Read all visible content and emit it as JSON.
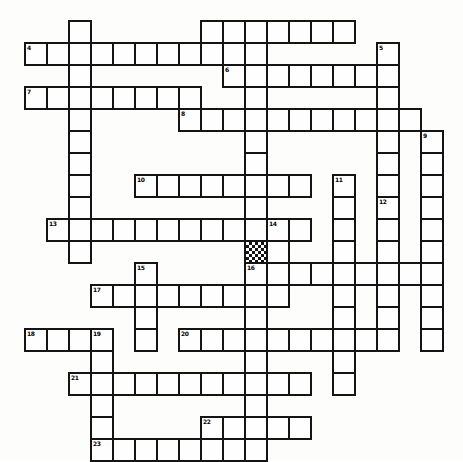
{
  "puzzle": {
    "title": "Crossword Puzzle Grid",
    "type": "crossword-grid",
    "grid_origin_x": 24,
    "grid_origin_y": 20,
    "cell_size": 22,
    "grid_columns": 20,
    "grid_rows": 20,
    "cell_fill_color": "#fefefe",
    "cell_border_color": "#141414",
    "background_color": "#fdfdfb",
    "shaded_cell_pattern": "checkerboard",
    "shaded_cells": [
      [
        10,
        10
      ]
    ],
    "entries": [
      {
        "number": "1",
        "direction": "down",
        "row": 0,
        "col": 2,
        "length": 11
      },
      {
        "number": "2",
        "direction": "down",
        "row": 0,
        "col": 8,
        "length": 2
      },
      {
        "number": "3",
        "direction": "across",
        "row": 0,
        "col": 10,
        "length": 5
      },
      {
        "number": "3",
        "direction": "down",
        "row": 0,
        "col": 10,
        "length": 13
      },
      {
        "number": "4",
        "direction": "across",
        "row": 1,
        "col": 0,
        "length": 10
      },
      {
        "number": "5",
        "direction": "down",
        "row": 1,
        "col": 16,
        "length": 9
      },
      {
        "number": "6",
        "direction": "across",
        "row": 2,
        "col": 9,
        "length": 7
      },
      {
        "number": "7",
        "direction": "across",
        "row": 3,
        "col": 0,
        "length": 8
      },
      {
        "number": "8",
        "direction": "across",
        "row": 4,
        "col": 7,
        "length": 11
      },
      {
        "number": "9",
        "direction": "down",
        "row": 5,
        "col": 18,
        "length": 9
      },
      {
        "number": "10",
        "direction": "across",
        "row": 7,
        "col": 5,
        "length": 8
      },
      {
        "number": "11",
        "direction": "down",
        "row": 7,
        "col": 14,
        "length": 7
      },
      {
        "number": "12",
        "direction": "down",
        "row": 8,
        "col": 16,
        "length": 6
      },
      {
        "number": "13",
        "direction": "across",
        "row": 9,
        "col": 1,
        "length": 12
      },
      {
        "number": "14",
        "direction": "down",
        "row": 9,
        "col": 11,
        "length": 3
      },
      {
        "number": "15",
        "direction": "down",
        "row": 11,
        "col": 5,
        "length": 4
      },
      {
        "number": "16",
        "direction": "across",
        "row": 11,
        "col": 10,
        "length": 8
      },
      {
        "number": "17",
        "direction": "across",
        "row": 12,
        "col": 3,
        "length": 9
      },
      {
        "number": "18",
        "direction": "across",
        "row": 14,
        "col": 0,
        "length": 4
      },
      {
        "number": "19",
        "direction": "down",
        "row": 14,
        "col": 3,
        "length": 7
      },
      {
        "number": "20",
        "direction": "across",
        "row": 14,
        "col": 7,
        "length": 9
      },
      {
        "number": "21",
        "direction": "across",
        "row": 16,
        "col": 2,
        "length": 11
      },
      {
        "number": "22",
        "direction": "across",
        "row": 18,
        "col": 8,
        "length": 5
      },
      {
        "number": "23",
        "direction": "across",
        "row": 19,
        "col": 3,
        "length": 7
      }
    ],
    "cells": [
      [
        0,
        2,
        ""
      ],
      [
        0,
        8,
        ""
      ],
      [
        0,
        9,
        ""
      ],
      [
        0,
        10,
        ""
      ],
      [
        0,
        11,
        ""
      ],
      [
        0,
        12,
        ""
      ],
      [
        0,
        13,
        ""
      ],
      [
        0,
        14,
        ""
      ],
      [
        1,
        0,
        "4"
      ],
      [
        1,
        1,
        ""
      ],
      [
        1,
        2,
        ""
      ],
      [
        1,
        3,
        ""
      ],
      [
        1,
        4,
        ""
      ],
      [
        1,
        5,
        ""
      ],
      [
        1,
        6,
        ""
      ],
      [
        1,
        7,
        ""
      ],
      [
        1,
        8,
        ""
      ],
      [
        1,
        9,
        ""
      ],
      [
        1,
        10,
        ""
      ],
      [
        1,
        16,
        "5"
      ],
      [
        2,
        2,
        ""
      ],
      [
        2,
        9,
        "6"
      ],
      [
        2,
        10,
        ""
      ],
      [
        2,
        11,
        ""
      ],
      [
        2,
        12,
        ""
      ],
      [
        2,
        13,
        ""
      ],
      [
        2,
        14,
        ""
      ],
      [
        2,
        15,
        ""
      ],
      [
        2,
        16,
        ""
      ],
      [
        3,
        0,
        "7"
      ],
      [
        3,
        1,
        ""
      ],
      [
        3,
        2,
        ""
      ],
      [
        3,
        3,
        ""
      ],
      [
        3,
        4,
        ""
      ],
      [
        3,
        5,
        ""
      ],
      [
        3,
        6,
        ""
      ],
      [
        3,
        7,
        ""
      ],
      [
        3,
        10,
        ""
      ],
      [
        3,
        16,
        ""
      ],
      [
        4,
        2,
        ""
      ],
      [
        4,
        7,
        "8"
      ],
      [
        4,
        8,
        ""
      ],
      [
        4,
        9,
        ""
      ],
      [
        4,
        10,
        ""
      ],
      [
        4,
        11,
        ""
      ],
      [
        4,
        12,
        ""
      ],
      [
        4,
        13,
        ""
      ],
      [
        4,
        14,
        ""
      ],
      [
        4,
        15,
        ""
      ],
      [
        4,
        16,
        ""
      ],
      [
        4,
        17,
        ""
      ],
      [
        5,
        2,
        ""
      ],
      [
        5,
        10,
        ""
      ],
      [
        5,
        16,
        ""
      ],
      [
        5,
        18,
        "9"
      ],
      [
        6,
        2,
        ""
      ],
      [
        6,
        10,
        ""
      ],
      [
        6,
        16,
        ""
      ],
      [
        6,
        18,
        ""
      ],
      [
        7,
        2,
        ""
      ],
      [
        7,
        5,
        "10"
      ],
      [
        7,
        6,
        ""
      ],
      [
        7,
        7,
        ""
      ],
      [
        7,
        8,
        ""
      ],
      [
        7,
        9,
        ""
      ],
      [
        7,
        10,
        ""
      ],
      [
        7,
        11,
        ""
      ],
      [
        7,
        12,
        ""
      ],
      [
        7,
        14,
        "11"
      ],
      [
        7,
        16,
        ""
      ],
      [
        7,
        18,
        ""
      ],
      [
        8,
        2,
        ""
      ],
      [
        8,
        10,
        ""
      ],
      [
        8,
        14,
        ""
      ],
      [
        8,
        16,
        "12"
      ],
      [
        8,
        18,
        ""
      ],
      [
        9,
        1,
        "13"
      ],
      [
        9,
        2,
        ""
      ],
      [
        9,
        3,
        ""
      ],
      [
        9,
        4,
        ""
      ],
      [
        9,
        5,
        ""
      ],
      [
        9,
        6,
        ""
      ],
      [
        9,
        7,
        ""
      ],
      [
        9,
        8,
        ""
      ],
      [
        9,
        9,
        ""
      ],
      [
        9,
        10,
        ""
      ],
      [
        9,
        11,
        "14"
      ],
      [
        9,
        12,
        ""
      ],
      [
        9,
        14,
        ""
      ],
      [
        9,
        16,
        ""
      ],
      [
        9,
        18,
        ""
      ],
      [
        10,
        2,
        ""
      ],
      [
        10,
        10,
        ""
      ],
      [
        10,
        11,
        ""
      ],
      [
        10,
        14,
        ""
      ],
      [
        10,
        16,
        ""
      ],
      [
        10,
        18,
        ""
      ],
      [
        11,
        5,
        "15"
      ],
      [
        11,
        10,
        "16"
      ],
      [
        11,
        11,
        ""
      ],
      [
        11,
        12,
        ""
      ],
      [
        11,
        13,
        ""
      ],
      [
        11,
        14,
        ""
      ],
      [
        11,
        15,
        ""
      ],
      [
        11,
        16,
        ""
      ],
      [
        11,
        17,
        ""
      ],
      [
        11,
        18,
        ""
      ],
      [
        12,
        3,
        "17"
      ],
      [
        12,
        4,
        ""
      ],
      [
        12,
        5,
        ""
      ],
      [
        12,
        6,
        ""
      ],
      [
        12,
        7,
        ""
      ],
      [
        12,
        8,
        ""
      ],
      [
        12,
        9,
        ""
      ],
      [
        12,
        10,
        ""
      ],
      [
        12,
        11,
        ""
      ],
      [
        12,
        14,
        ""
      ],
      [
        12,
        16,
        ""
      ],
      [
        12,
        18,
        ""
      ],
      [
        13,
        5,
        ""
      ],
      [
        13,
        10,
        ""
      ],
      [
        13,
        14,
        ""
      ],
      [
        13,
        16,
        ""
      ],
      [
        13,
        18,
        ""
      ],
      [
        14,
        0,
        "18"
      ],
      [
        14,
        1,
        ""
      ],
      [
        14,
        2,
        ""
      ],
      [
        14,
        3,
        "19"
      ],
      [
        14,
        5,
        ""
      ],
      [
        14,
        7,
        "20"
      ],
      [
        14,
        8,
        ""
      ],
      [
        14,
        9,
        ""
      ],
      [
        14,
        10,
        ""
      ],
      [
        14,
        11,
        ""
      ],
      [
        14,
        12,
        ""
      ],
      [
        14,
        13,
        ""
      ],
      [
        14,
        14,
        ""
      ],
      [
        14,
        15,
        ""
      ],
      [
        14,
        16,
        ""
      ],
      [
        14,
        18,
        ""
      ],
      [
        15,
        3,
        ""
      ],
      [
        15,
        10,
        ""
      ],
      [
        15,
        14,
        ""
      ],
      [
        16,
        2,
        "21"
      ],
      [
        16,
        3,
        ""
      ],
      [
        16,
        4,
        ""
      ],
      [
        16,
        5,
        ""
      ],
      [
        16,
        6,
        ""
      ],
      [
        16,
        7,
        ""
      ],
      [
        16,
        8,
        ""
      ],
      [
        16,
        9,
        ""
      ],
      [
        16,
        10,
        ""
      ],
      [
        16,
        11,
        ""
      ],
      [
        16,
        12,
        ""
      ],
      [
        16,
        14,
        ""
      ],
      [
        17,
        3,
        ""
      ],
      [
        17,
        10,
        ""
      ],
      [
        18,
        3,
        ""
      ],
      [
        18,
        8,
        "22"
      ],
      [
        18,
        9,
        ""
      ],
      [
        18,
        10,
        ""
      ],
      [
        18,
        11,
        ""
      ],
      [
        18,
        12,
        ""
      ],
      [
        19,
        3,
        "23"
      ],
      [
        19,
        4,
        ""
      ],
      [
        19,
        5,
        ""
      ],
      [
        19,
        6,
        ""
      ],
      [
        19,
        7,
        ""
      ],
      [
        19,
        8,
        ""
      ],
      [
        19,
        9,
        ""
      ],
      [
        19,
        10,
        ""
      ]
    ]
  }
}
